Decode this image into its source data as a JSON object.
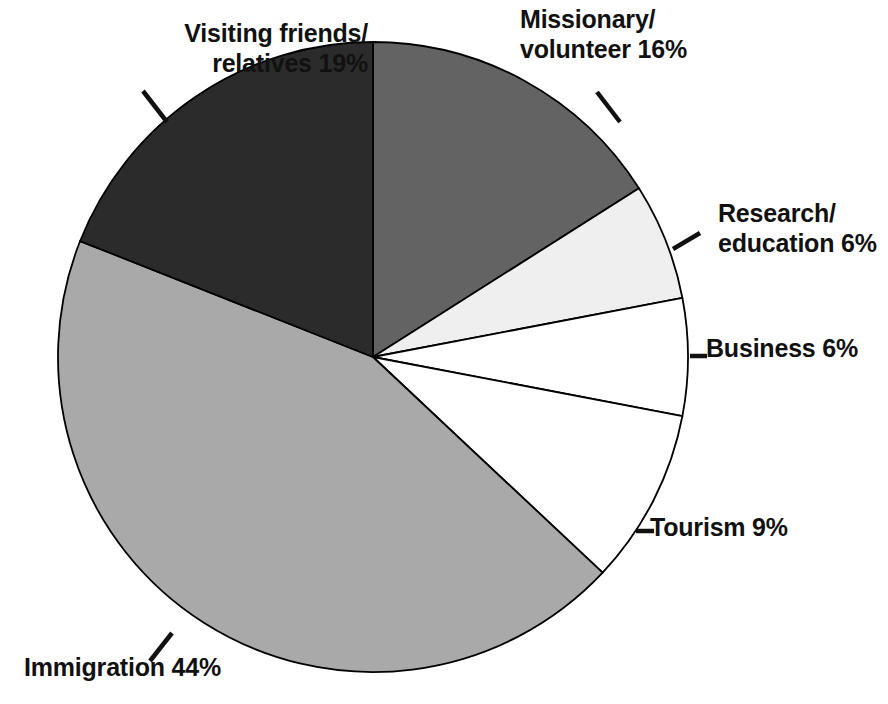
{
  "chart_data": {
    "type": "pie",
    "title": "",
    "subtitle": "",
    "xlabel": "",
    "ylabel": "",
    "legend_position": "none",
    "grid": false,
    "start_angle_deg": 0,
    "direction": "clockwise",
    "units": "percent",
    "categories": [
      "Missionary/ volunteer",
      "Research/ education",
      "Business",
      "Tourism",
      "Immigration",
      "Visiting friends/ relatives"
    ],
    "values": [
      16,
      6,
      6,
      9,
      44,
      19
    ],
    "labels": [
      "Missionary/\nvolunteer 16%",
      "Research/\neducation 6%",
      "Business 6%",
      "Tourism 9%",
      "Immigration 44%",
      "Visiting friends/\nrelatives 19%"
    ],
    "colors": [
      "#636363",
      "#efefef",
      "#ffffff",
      "#ffffff",
      "#a9a9a9",
      "#2b2b2b"
    ],
    "slice_outline_color": "#000000"
  },
  "slices": [
    {
      "name": "missionary-volunteer",
      "line1": "Missionary/",
      "line2": "volunteer 16%",
      "value": 16,
      "color": "#636363"
    },
    {
      "name": "research-education",
      "line1": "Research/",
      "line2": "education 6%",
      "value": 6,
      "color": "#efefef"
    },
    {
      "name": "business",
      "line1": "Business 6%",
      "line2": "",
      "value": 6,
      "color": "#ffffff"
    },
    {
      "name": "tourism",
      "line1": "Tourism 9%",
      "line2": "",
      "value": 9,
      "color": "#ffffff"
    },
    {
      "name": "immigration",
      "line1": "Immigration 44%",
      "line2": "",
      "value": 44,
      "color": "#a9a9a9"
    },
    {
      "name": "visiting-friends-relatives",
      "line1": "Visiting friends/",
      "line2": "relatives 19%",
      "value": 19,
      "color": "#2b2b2b"
    }
  ],
  "labels": {
    "missionary_l1": "Missionary/",
    "missionary_l2": "volunteer 16%",
    "research_l1": "Research/",
    "research_l2": "education 6%",
    "business": "Business 6%",
    "business_dash": "-",
    "tourism": "Tourism 9%",
    "tourism_dash": "-",
    "immigration": "Immigration 44%",
    "visiting_l1": "Visiting friends/",
    "visiting_l2": "relatives 19%"
  }
}
